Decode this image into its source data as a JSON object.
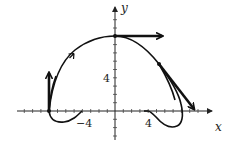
{
  "figure": {
    "axis_labels": {
      "x": "x",
      "y": "y"
    },
    "x_ticks": [
      {
        "value": -4,
        "label": "−4"
      },
      {
        "value": 4,
        "label": "4"
      }
    ],
    "y_ticks": [
      {
        "value": 4,
        "label": "4"
      }
    ],
    "curve": {
      "description": "closed parametric loop curve with direction arrow",
      "color": "#111111"
    },
    "vectors": [
      {
        "name": "velocity-at-left-point",
        "from": [
          -8,
          0
        ],
        "direction": "up"
      },
      {
        "name": "velocity-at-top-point",
        "from": [
          0,
          9
        ],
        "direction": "right"
      },
      {
        "name": "velocity-at-right-point",
        "from": [
          5.5,
          5.7
        ],
        "direction": "down-right"
      }
    ]
  }
}
